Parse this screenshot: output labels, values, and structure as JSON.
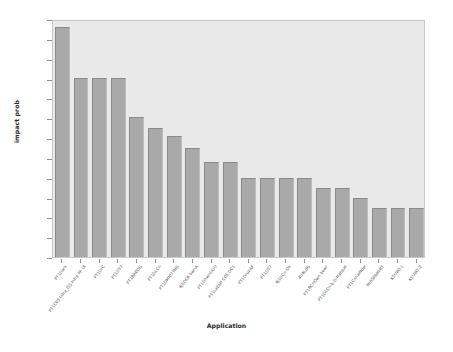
{
  "chart_data": {
    "type": "bar",
    "title": "",
    "xlabel": "Application",
    "ylabel": "impact prob",
    "ylim": [
      0.0,
      0.3
    ],
    "yticks": [
      "0.000",
      "0.025",
      "0.050",
      "0.075",
      "0.100",
      "0.125",
      "0.150",
      "0.175",
      "0.200",
      "0.225",
      "0.250",
      "0.275",
      "0.300"
    ],
    "ytick_values": [
      0.0,
      0.025,
      0.05,
      0.075,
      0.1,
      0.125,
      0.15,
      0.175,
      0.2,
      0.225,
      0.25,
      0.275,
      0.3
    ],
    "grid": false,
    "legend": "none",
    "orientation": "vertical",
    "bar_color": "#a9a9a9",
    "plot_bg": "#e9e9e9",
    "figure_bg": "#ffffff",
    "categories": [
      "PT1Dark",
      "PT1C05 Infra_OS Infra FP UI",
      "PT1DrC",
      "PT1DT7",
      "PT1BR0DG",
      "PT1DLCn",
      "PT1DMNU fNG",
      "4J5DCK bwnA",
      "PT1DhwnDGU",
      "PT1LabsH C05 DC1",
      "PT1DrukAF",
      "PT1DT7",
      "4J1DCn-Ok",
      "4U4LdG",
      "PT1BCnOwn bowr",
      "PT1DLCn-b-D-Nabbat",
      "PT1CnnwNdw",
      "NtRSPARkRT",
      "K5U8O-J",
      "K5U8O-Z"
    ],
    "values": [
      0.29,
      0.226,
      0.226,
      0.226,
      0.176,
      0.162,
      0.152,
      0.137,
      0.12,
      0.12,
      0.099,
      0.099,
      0.099,
      0.099,
      0.087,
      0.087,
      0.075,
      0.062,
      0.062,
      0.062
    ]
  }
}
